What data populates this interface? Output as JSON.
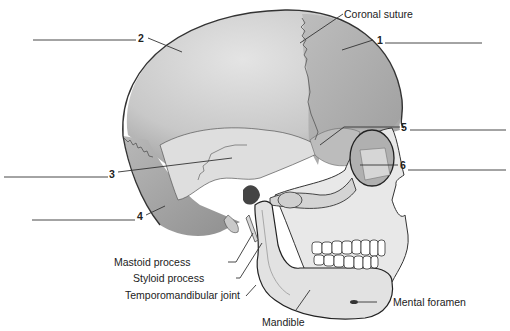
{
  "diagram": {
    "numbered_labels": [
      {
        "number": "1",
        "answer_blank": ""
      },
      {
        "number": "2",
        "answer_blank": ""
      },
      {
        "number": "3",
        "answer_blank": ""
      },
      {
        "number": "4",
        "answer_blank": ""
      },
      {
        "number": "5",
        "answer_blank": ""
      },
      {
        "number": "6",
        "answer_blank": ""
      }
    ],
    "named_labels": {
      "coronal_suture": "Coronal suture",
      "mastoid_process": "Mastoid process",
      "styloid_process": "Styloid process",
      "temporomandibular_joint": "Temporomandibular joint",
      "mandible": "Mandible",
      "mental_foramen": "Mental foramen"
    },
    "colors": {
      "parietal": "#d2d2d2",
      "frontal": "#b4b4b4",
      "temporal": "#dcdcdc",
      "occipital": "#a9a9a9",
      "face": "#e6e6e6",
      "mandible": "#e2e2e2",
      "outline": "#333333",
      "teeth": "#ffffff"
    }
  }
}
